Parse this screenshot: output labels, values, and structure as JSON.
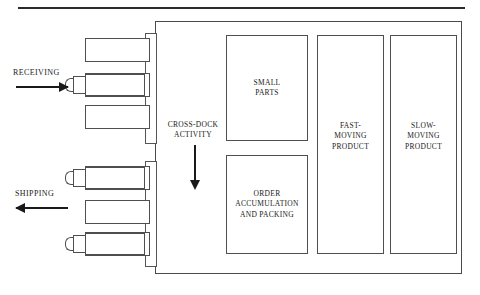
{
  "diagram": {
    "flows": [
      {
        "id": "receiving",
        "label": "RECEIVING",
        "direction": "right"
      },
      {
        "id": "shipping",
        "label": "SHIPPING",
        "direction": "left"
      }
    ],
    "crossdock": {
      "label": "CROSS-DOCK\nACTIVITY",
      "arrow_direction": "down"
    },
    "dock_strips": [
      {
        "id": "receiving-dock-strip",
        "side": "left",
        "section": "receiving"
      },
      {
        "id": "shipping-dock-strip",
        "side": "left",
        "section": "shipping"
      }
    ],
    "receiving_bays": [
      {
        "id": "receiving-bay-1",
        "occupied": false
      },
      {
        "id": "receiving-bay-2",
        "occupied": true
      },
      {
        "id": "receiving-bay-3",
        "occupied": false
      }
    ],
    "shipping_bays": [
      {
        "id": "shipping-bay-1",
        "occupied": true
      },
      {
        "id": "shipping-bay-2",
        "occupied": false
      },
      {
        "id": "shipping-bay-3",
        "occupied": true
      }
    ],
    "zones": [
      {
        "id": "small-parts",
        "label": "SMALL\nPARTS"
      },
      {
        "id": "order-accum",
        "label": "ORDER\nACCUMULATION\nAND PACKING"
      },
      {
        "id": "fast-moving",
        "label": "FAST-\nMOVING\nPRODUCT"
      },
      {
        "id": "slow-moving",
        "label": "SLOW-\nMOVING\nPRODUCT"
      }
    ],
    "colors": {
      "line": "#4f4f4f",
      "text": "#1a1a1a",
      "rule": "#2b2b2b",
      "background": "#ffffff"
    }
  }
}
